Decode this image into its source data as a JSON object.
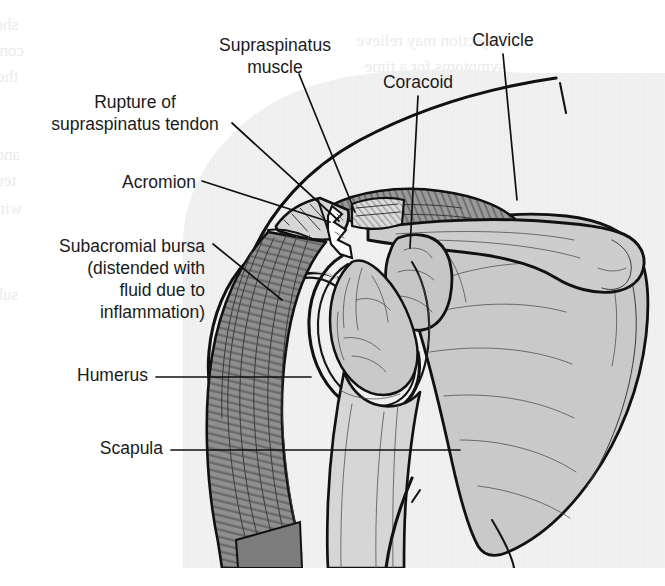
{
  "figure": {
    "kind": "anatomical-illustration",
    "canvas": {
      "width": 665,
      "height": 586
    },
    "panel": {
      "fill": "#f1f1f1",
      "note": "light grey illustration plate with faint scan texture"
    }
  },
  "palette": {
    "ink": "#111111",
    "page": "#ffffff",
    "panel_grey": "#f1f1f1",
    "bone_grey": "#c9c9c9",
    "bone_light": "#d8d8d8",
    "muscle_grey": "#8f8f8f",
    "muscle_dark": "#6e6e6e",
    "tendon_light": "#dcdcdc",
    "rupture_white": "#fdfdfd",
    "ghost_text": "#ebebeb"
  },
  "labels": [
    {
      "id": "supraspinatus-muscle",
      "lines": [
        "Supraspinatus",
        "muscle"
      ],
      "anchor": "middle",
      "x": 275,
      "y": 46,
      "line_height": 22
    },
    {
      "id": "rupture-supraspinatus-tendon",
      "lines": [
        "Rupture of",
        "supraspinatus tendon"
      ],
      "anchor": "middle",
      "x": 135,
      "y": 103,
      "line_height": 22
    },
    {
      "id": "acromion",
      "lines": [
        "Acromion"
      ],
      "anchor": "end",
      "x": 196,
      "y": 183,
      "line_height": 22
    },
    {
      "id": "subacromial-bursa",
      "lines": [
        "Subacromial bursa",
        "(distended with",
        "fluid due to",
        "inflammation)"
      ],
      "anchor": "end",
      "x": 205,
      "y": 247,
      "line_height": 22
    },
    {
      "id": "humerus",
      "lines": [
        "Humerus"
      ],
      "anchor": "end",
      "x": 148,
      "y": 376,
      "line_height": 22
    },
    {
      "id": "scapula",
      "lines": [
        "Scapula"
      ],
      "anchor": "end",
      "x": 163,
      "y": 449,
      "line_height": 22
    },
    {
      "id": "coracoid",
      "lines": [
        "Coracoid"
      ],
      "anchor": "middle",
      "x": 418,
      "y": 83,
      "line_height": 22
    },
    {
      "id": "clavicle",
      "lines": [
        "Clavicle"
      ],
      "anchor": "middle",
      "x": 503,
      "y": 41,
      "line_height": 22
    }
  ],
  "leader_lines": [
    {
      "id": "leader-supraspinatus-muscle",
      "d": "M 299 74 L 355 212"
    },
    {
      "id": "leader-rupture-tendon",
      "d": "M 232 123 L 339 221"
    },
    {
      "id": "leader-acromion",
      "d": "M 202 181 L 330 222"
    },
    {
      "id": "leader-subacromial-bursa",
      "d": "M 213 244 L 282 300"
    },
    {
      "id": "leader-humerus",
      "d": "M 156 377 L 311 377"
    },
    {
      "id": "leader-scapula",
      "d": "M 171 450 L 460 450"
    },
    {
      "id": "leader-coracoid",
      "d": "M 418 96 L 410 248"
    },
    {
      "id": "leader-clavicle",
      "d": "M 503 54 L 517 200"
    }
  ],
  "structures": [
    {
      "id": "scapula-body",
      "name": "Scapula (body and spine)",
      "tone": "bone_grey"
    },
    {
      "id": "glenoid",
      "name": "Glenoid fossa",
      "tone": "bone_grey"
    },
    {
      "id": "humeral-head",
      "name": "Head of humerus",
      "tone": "bone_grey"
    },
    {
      "id": "humerus-shaft",
      "name": "Shaft of humerus",
      "tone": "bone_light"
    },
    {
      "id": "clavicle-bone",
      "name": "Clavicle",
      "tone": "bone_grey"
    },
    {
      "id": "coracoid-process",
      "name": "Coracoid process",
      "tone": "bone_grey"
    },
    {
      "id": "acromion-process",
      "name": "Acromion",
      "tone": "bone_light"
    },
    {
      "id": "supraspinatus-belly",
      "name": "Supraspinatus muscle belly",
      "tone": "muscle_grey"
    },
    {
      "id": "supraspinatus-tendon-stump",
      "name": "Torn supraspinatus tendon",
      "tone": "tendon_light"
    },
    {
      "id": "rupture-gap",
      "name": "Rupture gap",
      "tone": "rupture_white"
    },
    {
      "id": "subacromial-bursa-sac",
      "name": "Distended subacromial bursa",
      "tone": "panel_grey"
    },
    {
      "id": "deltoid-muscle",
      "name": "Deltoid muscle",
      "tone": "muscle_dark"
    }
  ],
  "ghost_text": {
    "note": "faint mirrored bleed-through from reverse of scanned page",
    "rows": [
      {
        "x": 18,
        "y": 30,
        "text": "shoulder and chest wall muscles are involved"
      },
      {
        "x": 24,
        "y": 56,
        "text": "compensatory movements of the scapula"
      },
      {
        "x": 18,
        "y": 82,
        "text": "the rotator cuff is the main stabiliser"
      },
      {
        "x": 20,
        "y": 160,
        "text": "and severe pain on abduction"
      },
      {
        "x": 16,
        "y": 186,
        "text": "tendon degeneration increases"
      },
      {
        "x": 22,
        "y": 214,
        "text": "with advancing age"
      },
      {
        "x": 18,
        "y": 300,
        "text": "subacromial space narrows"
      },
      {
        "x": 500,
        "y": 46,
        "text": "injection may relieve"
      },
      {
        "x": 505,
        "y": 72,
        "text": "symptoms for a time"
      }
    ]
  }
}
